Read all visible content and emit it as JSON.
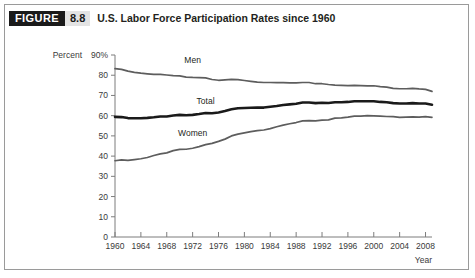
{
  "figure": {
    "badge_word": "FIGURE",
    "badge_number": "8.8",
    "title": "U.S. Labor Force Participation Rates since 1960"
  },
  "chart_data": {
    "type": "line",
    "title": "U.S. Labor Force Participation Rates since 1960",
    "xlabel": "Year",
    "ylabel": "Percent",
    "ylim": [
      0,
      90
    ],
    "xlim": [
      1960,
      2009
    ],
    "grid": false,
    "legend": "inline-labels",
    "ytick_labels": [
      "90%",
      "80",
      "70",
      "60",
      "50",
      "40",
      "30",
      "20",
      "10",
      "0"
    ],
    "ytick_values": [
      90,
      80,
      70,
      60,
      50,
      40,
      30,
      20,
      10,
      0
    ],
    "xtick_labels": [
      "1960",
      "1964",
      "1968",
      "1972",
      "1976",
      "1980",
      "1984",
      "1988",
      "1992",
      "1996",
      "2000",
      "2004",
      "2008"
    ],
    "xtick_values": [
      1960,
      1964,
      1968,
      1972,
      1976,
      1980,
      1984,
      1988,
      1992,
      1996,
      2000,
      2004,
      2008
    ],
    "x": [
      1960,
      1961,
      1962,
      1963,
      1964,
      1965,
      1966,
      1967,
      1968,
      1969,
      1970,
      1971,
      1972,
      1973,
      1974,
      1975,
      1976,
      1977,
      1978,
      1979,
      1980,
      1981,
      1982,
      1983,
      1984,
      1985,
      1986,
      1987,
      1988,
      1989,
      1990,
      1991,
      1992,
      1993,
      1994,
      1995,
      1996,
      1997,
      1998,
      1999,
      2000,
      2001,
      2002,
      2003,
      2004,
      2005,
      2006,
      2007,
      2008,
      2009
    ],
    "series": [
      {
        "name": "Men",
        "color": "#5d5d5d",
        "width": 1.7,
        "label_x": 1972,
        "label_y": 86,
        "values": [
          83.3,
          82.9,
          82.0,
          81.4,
          81.0,
          80.7,
          80.4,
          80.4,
          80.1,
          79.8,
          79.7,
          79.1,
          78.9,
          78.8,
          78.7,
          77.9,
          77.5,
          77.7,
          77.9,
          77.8,
          77.4,
          77.0,
          76.6,
          76.4,
          76.4,
          76.3,
          76.3,
          76.2,
          76.2,
          76.4,
          76.4,
          75.8,
          75.8,
          75.4,
          75.1,
          75.0,
          74.9,
          75.0,
          74.9,
          74.7,
          74.8,
          74.4,
          74.1,
          73.5,
          73.3,
          73.3,
          73.5,
          73.2,
          73.0,
          72.0
        ]
      },
      {
        "name": "Total",
        "color": "#1a1a1a",
        "width": 2.6,
        "label_x": 1974,
        "label_y": 66,
        "values": [
          59.4,
          59.3,
          58.8,
          58.7,
          58.7,
          58.9,
          59.2,
          59.6,
          59.6,
          60.1,
          60.4,
          60.2,
          60.4,
          60.8,
          61.3,
          61.2,
          61.6,
          62.3,
          63.2,
          63.7,
          63.8,
          63.9,
          64.0,
          64.0,
          64.4,
          64.8,
          65.3,
          65.6,
          65.9,
          66.5,
          66.5,
          66.2,
          66.4,
          66.3,
          66.6,
          66.6,
          66.8,
          67.1,
          67.1,
          67.1,
          67.1,
          66.8,
          66.6,
          66.2,
          66.0,
          66.0,
          66.2,
          66.0,
          66.0,
          65.4
        ]
      },
      {
        "name": "Women",
        "color": "#5d5d5d",
        "width": 1.7,
        "label_x": 1972,
        "label_y": 50,
        "values": [
          37.7,
          38.1,
          37.9,
          38.3,
          38.7,
          39.3,
          40.3,
          41.1,
          41.6,
          42.7,
          43.3,
          43.4,
          43.9,
          44.7,
          45.7,
          46.3,
          47.3,
          48.4,
          50.0,
          50.9,
          51.5,
          52.1,
          52.6,
          52.9,
          53.6,
          54.5,
          55.3,
          56.0,
          56.6,
          57.4,
          57.5,
          57.4,
          57.8,
          57.9,
          58.8,
          58.9,
          59.3,
          59.8,
          59.8,
          60.0,
          59.9,
          59.8,
          59.6,
          59.5,
          59.2,
          59.3,
          59.4,
          59.3,
          59.5,
          59.2
        ]
      }
    ]
  }
}
